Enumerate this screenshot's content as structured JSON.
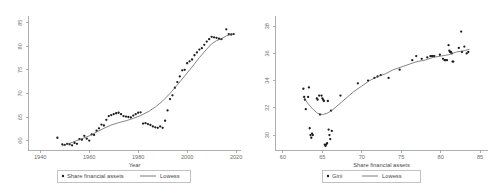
{
  "chart_data": [
    {
      "id": "share-financial-assets-by-year",
      "type": "scatter",
      "title": "",
      "xlabel": "Year",
      "ylabel": "",
      "xlim": [
        1935,
        2022
      ],
      "ylim": [
        58,
        86
      ],
      "xticks": [
        1940,
        1960,
        1980,
        2000,
        2020
      ],
      "yticks": [
        60,
        65,
        70,
        75,
        80,
        85
      ],
      "grid": false,
      "legend_position": "below",
      "series": [
        {
          "name": "Share financial assets",
          "type": "scatter",
          "marker": "filled-circle",
          "color": "#1c1c1c",
          "points": [
            [
              1947,
              60.6
            ],
            [
              1949,
              59.2
            ],
            [
              1950,
              59.1
            ],
            [
              1951,
              59.3
            ],
            [
              1952,
              59.2
            ],
            [
              1953,
              59.0
            ],
            [
              1954,
              59.5
            ],
            [
              1955,
              59.3
            ],
            [
              1956,
              60.3
            ],
            [
              1957,
              60.2
            ],
            [
              1958,
              61.0
            ],
            [
              1959,
              60.4
            ],
            [
              1960,
              60.0
            ],
            [
              1961,
              61.3
            ],
            [
              1962,
              61.2
            ],
            [
              1963,
              62.1
            ],
            [
              1964,
              62.6
            ],
            [
              1965,
              63.4
            ],
            [
              1966,
              63.2
            ],
            [
              1967,
              64.4
            ],
            [
              1968,
              65.2
            ],
            [
              1969,
              65.4
            ],
            [
              1970,
              65.6
            ],
            [
              1971,
              65.8
            ],
            [
              1972,
              65.9
            ],
            [
              1973,
              65.6
            ],
            [
              1974,
              65.2
            ],
            [
              1975,
              65.1
            ],
            [
              1976,
              65.0
            ],
            [
              1977,
              64.9
            ],
            [
              1978,
              65.3
            ],
            [
              1979,
              65.6
            ],
            [
              1980,
              65.9
            ],
            [
              1981,
              66.0
            ],
            [
              1982,
              63.6
            ],
            [
              1983,
              63.7
            ],
            [
              1984,
              63.5
            ],
            [
              1985,
              63.3
            ],
            [
              1986,
              63.0
            ],
            [
              1987,
              62.8
            ],
            [
              1988,
              62.7
            ],
            [
              1989,
              63.0
            ],
            [
              1990,
              62.7
            ],
            [
              1991,
              64.2
            ],
            [
              1992,
              66.4
            ],
            [
              1993,
              68.8
            ],
            [
              1994,
              69.6
            ],
            [
              1995,
              71.2
            ],
            [
              1996,
              72.4
            ],
            [
              1997,
              73.6
            ],
            [
              1998,
              74.9
            ],
            [
              1999,
              75.0
            ],
            [
              2000,
              76.4
            ],
            [
              2001,
              76.8
            ],
            [
              2002,
              77.2
            ],
            [
              2003,
              78.1
            ],
            [
              2004,
              78.7
            ],
            [
              2005,
              79.3
            ],
            [
              2006,
              79.6
            ],
            [
              2007,
              80.3
            ],
            [
              2008,
              81.0
            ],
            [
              2009,
              81.5
            ],
            [
              2010,
              82.0
            ],
            [
              2011,
              81.9
            ],
            [
              2012,
              81.8
            ],
            [
              2013,
              81.6
            ],
            [
              2014,
              81.5
            ],
            [
              2016,
              83.6
            ],
            [
              2017,
              82.6
            ],
            [
              2018,
              82.5
            ],
            [
              2019,
              82.6
            ]
          ]
        },
        {
          "name": "Lowess",
          "type": "line",
          "color": "#5c5c5c",
          "points": [
            [
              1949,
              58.9
            ],
            [
              1953,
              59.6
            ],
            [
              1957,
              60.4
            ],
            [
              1960,
              61.0
            ],
            [
              1963,
              61.8
            ],
            [
              1966,
              62.6
            ],
            [
              1969,
              63.3
            ],
            [
              1972,
              63.8
            ],
            [
              1975,
              64.2
            ],
            [
              1978,
              64.7
            ],
            [
              1981,
              65.3
            ],
            [
              1984,
              66.1
            ],
            [
              1987,
              67.1
            ],
            [
              1990,
              68.4
            ],
            [
              1993,
              70.0
            ],
            [
              1996,
              71.8
            ],
            [
              1999,
              73.7
            ],
            [
              2002,
              75.6
            ],
            [
              2005,
              77.6
            ],
            [
              2008,
              79.4
            ],
            [
              2010,
              80.5
            ],
            [
              2012,
              81.2
            ],
            [
              2014,
              81.6
            ],
            [
              2016,
              82.2
            ],
            [
              2018,
              82.5
            ],
            [
              2019,
              82.6
            ]
          ]
        }
      ],
      "legend": [
        {
          "label": "Share financial assets",
          "type": "marker"
        },
        {
          "label": "Lowess",
          "type": "line"
        }
      ]
    },
    {
      "id": "gini-vs-share-financial-assets",
      "type": "scatter",
      "title": "",
      "xlabel": "Share financial assets",
      "ylabel": "",
      "xlim": [
        59,
        86
      ],
      "ylim": [
        28.9,
        38.6
      ],
      "xticks": [
        60,
        65,
        70,
        75,
        80,
        85
      ],
      "yticks": [
        30,
        32,
        34,
        36,
        38
      ],
      "grid": false,
      "legend_position": "below",
      "series": [
        {
          "name": "Gini",
          "type": "scatter",
          "marker": "filled-circle",
          "color": "#1c1c1c",
          "points": [
            [
              62.6,
              33.4
            ],
            [
              62.7,
              32.8
            ],
            [
              62.8,
              32.6
            ],
            [
              62.9,
              31.9
            ],
            [
              63.2,
              32.8
            ],
            [
              63.3,
              33.5
            ],
            [
              63.4,
              30.5
            ],
            [
              63.5,
              30.0
            ],
            [
              63.6,
              29.8
            ],
            [
              63.7,
              30.1
            ],
            [
              63.8,
              30.0
            ],
            [
              64.3,
              32.7
            ],
            [
              64.4,
              32.6
            ],
            [
              64.6,
              32.9
            ],
            [
              64.7,
              31.5
            ],
            [
              64.9,
              32.9
            ],
            [
              65.0,
              32.7
            ],
            [
              65.1,
              32.6
            ],
            [
              65.2,
              32.5
            ],
            [
              65.3,
              29.3
            ],
            [
              65.4,
              29.2
            ],
            [
              65.5,
              29.3
            ],
            [
              65.6,
              29.4
            ],
            [
              65.7,
              32.5
            ],
            [
              65.8,
              30.4
            ],
            [
              65.9,
              30.0
            ],
            [
              66.0,
              29.7
            ],
            [
              66.1,
              31.8
            ],
            [
              66.2,
              30.3
            ],
            [
              67.3,
              32.9
            ],
            [
              69.5,
              33.8
            ],
            [
              70.8,
              34.0
            ],
            [
              71.6,
              34.2
            ],
            [
              72.0,
              34.3
            ],
            [
              72.4,
              34.4
            ],
            [
              73.4,
              34.2
            ],
            [
              74.8,
              34.8
            ],
            [
              76.4,
              35.5
            ],
            [
              76.9,
              35.8
            ],
            [
              77.6,
              35.6
            ],
            [
              78.3,
              35.7
            ],
            [
              78.7,
              35.8
            ],
            [
              78.9,
              35.8
            ],
            [
              79.0,
              35.8
            ],
            [
              79.2,
              35.8
            ],
            [
              79.9,
              35.9
            ],
            [
              80.3,
              35.6
            ],
            [
              80.5,
              35.5
            ],
            [
              80.6,
              35.5
            ],
            [
              80.8,
              35.5
            ],
            [
              81.0,
              36.6
            ],
            [
              81.1,
              36.2
            ],
            [
              81.2,
              36.1
            ],
            [
              81.3,
              36.1
            ],
            [
              81.4,
              36.0
            ],
            [
              81.5,
              35.4
            ],
            [
              81.6,
              35.4
            ],
            [
              82.3,
              36.4
            ],
            [
              82.6,
              37.6
            ],
            [
              82.7,
              36.1
            ],
            [
              83.0,
              36.5
            ],
            [
              83.3,
              36.0
            ],
            [
              83.5,
              36.1
            ]
          ]
        },
        {
          "name": "Lowess",
          "type": "line",
          "color": "#5c5c5c",
          "points": [
            [
              62.6,
              32.8
            ],
            [
              63.2,
              32.3
            ],
            [
              63.8,
              31.9
            ],
            [
              64.4,
              31.6
            ],
            [
              65.0,
              31.5
            ],
            [
              65.6,
              31.6
            ],
            [
              66.2,
              31.8
            ],
            [
              67.0,
              32.2
            ],
            [
              68.0,
              32.7
            ],
            [
              69.0,
              33.2
            ],
            [
              70.0,
              33.6
            ],
            [
              71.0,
              34.0
            ],
            [
              72.0,
              34.3
            ],
            [
              73.0,
              34.5
            ],
            [
              74.0,
              34.8
            ],
            [
              75.0,
              35.0
            ],
            [
              76.0,
              35.2
            ],
            [
              77.0,
              35.4
            ],
            [
              78.0,
              35.5
            ],
            [
              79.0,
              35.7
            ],
            [
              80.0,
              35.8
            ],
            [
              81.0,
              35.9
            ],
            [
              82.0,
              36.1
            ],
            [
              83.0,
              36.2
            ],
            [
              83.6,
              36.3
            ]
          ]
        }
      ],
      "legend": [
        {
          "label": "Gini",
          "type": "marker"
        },
        {
          "label": "Lowess",
          "type": "line"
        }
      ]
    }
  ]
}
